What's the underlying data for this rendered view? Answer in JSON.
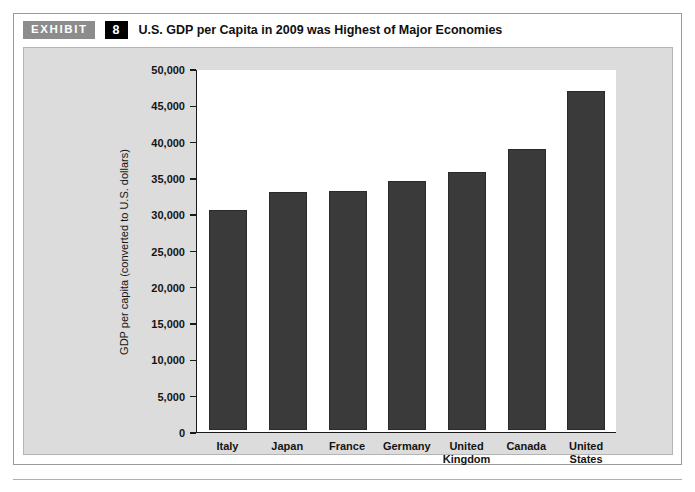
{
  "exhibit": {
    "tag_label": "EXHIBIT",
    "number": "8",
    "title": "U.S. GDP per Capita in 2009 was Highest of Major Economies"
  },
  "colors": {
    "bar": "#3a3a3a",
    "panel_background": "#dcdcdc",
    "plot_background": "#ffffff",
    "axis": "#1a1a1a",
    "tag_background": "#8c8c8c",
    "number_background": "#000000"
  },
  "chart_data": {
    "type": "bar",
    "title": "U.S. GDP per Capita in 2009 was Highest of Major Economies",
    "xlabel": "",
    "ylabel": "GDP per capita (converted to U.S. dollars)",
    "categories": [
      "Italy",
      "Japan",
      "France",
      "Germany",
      "United Kingdom",
      "Canada",
      "United States"
    ],
    "values": [
      30400,
      32800,
      33000,
      34300,
      35600,
      38800,
      46800
    ],
    "ylim": [
      0,
      50000
    ],
    "ytick_values": [
      0,
      5000,
      10000,
      15000,
      20000,
      25000,
      30000,
      35000,
      40000,
      45000,
      50000
    ],
    "ytick_labels": [
      "0",
      "5,000",
      "10,000",
      "15,000",
      "20,000",
      "25,000",
      "30,000",
      "35,000",
      "40,000",
      "45,000",
      "50,000"
    ],
    "grid": false,
    "legend": false
  }
}
